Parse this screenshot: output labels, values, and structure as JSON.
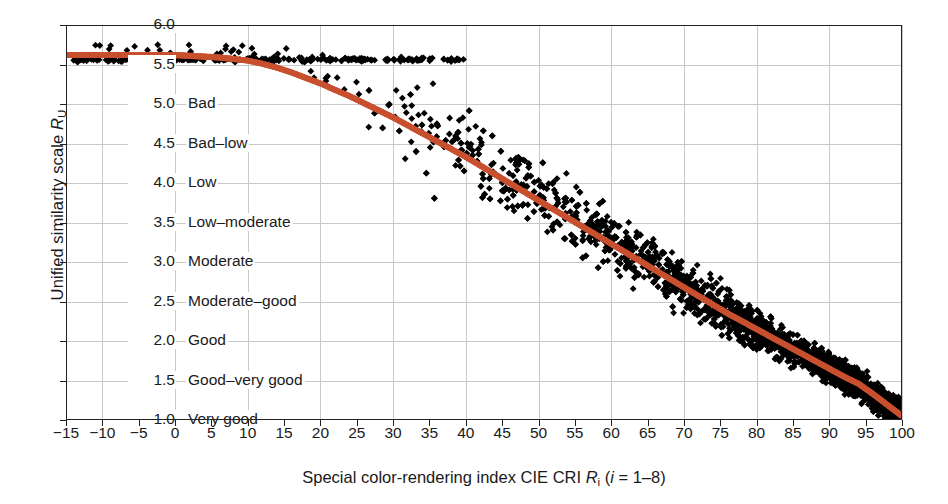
{
  "figure": {
    "title": "",
    "x_axis_title_parts": {
      "pre": "Special color-rendering index CIE CRI ",
      "symbol": "R",
      "subscript": "i",
      "post": " (",
      "italic_i": "i",
      "equals": " = 1–8)"
    },
    "y_axis_title_parts": {
      "pre": "Unified similarity scale ",
      "symbol": "R",
      "subscript": "U"
    }
  },
  "axes": {
    "x_label_full": "Special color-rendering index CIE CRI Ri (i = 1–8)",
    "y_label_full": "Unified similarity scale RU",
    "x_ticks": [
      -15,
      -10,
      -5,
      0,
      5,
      10,
      15,
      20,
      25,
      30,
      35,
      40,
      45,
      50,
      55,
      60,
      65,
      70,
      75,
      80,
      85,
      90,
      95,
      100
    ],
    "x_tick_labels": [
      "−15",
      "−10",
      "−5",
      "0",
      "5",
      "10",
      "15",
      "20",
      "25",
      "30",
      "35",
      "40",
      "45",
      "50",
      "55",
      "60",
      "65",
      "70",
      "75",
      "80",
      "85",
      "90",
      "95",
      "100"
    ],
    "x_gridlines": [
      -10,
      0,
      10,
      20,
      30,
      40,
      50,
      60,
      70,
      80,
      90,
      100
    ],
    "xlim": [
      -15,
      100
    ],
    "y_ticks": [
      1.0,
      1.5,
      2.0,
      2.5,
      3.0,
      3.5,
      4.0,
      4.5,
      5.0,
      5.5,
      6.0
    ],
    "y_tick_labels": [
      "1.0",
      "1.5",
      "2.0",
      "2.5",
      "3.0",
      "3.5",
      "4.0",
      "4.5",
      "5.0",
      "5.5",
      "6.0"
    ],
    "ylim": [
      1.0,
      6.0
    ],
    "grid": "on",
    "grid_color": "#c9c9c9",
    "frame_color": "#222222"
  },
  "scale_descriptors": [
    {
      "value": 5.0,
      "label": "Bad"
    },
    {
      "value": 4.5,
      "label": "Bad–low"
    },
    {
      "value": 4.0,
      "label": "Low"
    },
    {
      "value": 3.5,
      "label": "Low–moderate"
    },
    {
      "value": 3.0,
      "label": "Moderate"
    },
    {
      "value": 2.5,
      "label": "Moderate–good"
    },
    {
      "value": 2.0,
      "label": "Good"
    },
    {
      "value": 1.5,
      "label": "Good–very good"
    },
    {
      "value": 1.0,
      "label": "Very good"
    }
  ],
  "colors": {
    "curve": "#c8502f",
    "scatter": "#000000",
    "grid": "#c9c9c9",
    "axis": "#222222",
    "background": "#ffffff"
  },
  "chart_data": {
    "type": "scatter",
    "title": "",
    "xlabel": "Special color-rendering index CIE CRI Ri (i = 1–8)",
    "ylabel": "Unified similarity scale RU",
    "xlim": [
      -15,
      100
    ],
    "ylim": [
      1.0,
      6.0
    ],
    "grid": true,
    "legend": "none",
    "series": [
      {
        "name": "Fitted relation (CIE CRI Ri vs unified similarity scale RU)",
        "type": "line",
        "color": "#c8502f",
        "marker": "dot",
        "x": [
          -15,
          -12,
          -10,
          -8,
          -6,
          -4,
          -2,
          0,
          2,
          4,
          6,
          8,
          10,
          12,
          14,
          16,
          18,
          20,
          22,
          24,
          26,
          28,
          30,
          32,
          34,
          36,
          38,
          40,
          42,
          44,
          46,
          48,
          50,
          52,
          54,
          56,
          58,
          60,
          62,
          64,
          66,
          68,
          70,
          72,
          74,
          76,
          78,
          80,
          82,
          84,
          86,
          88,
          90,
          92,
          94,
          96,
          98,
          100
        ],
        "y": [
          5.62,
          5.62,
          5.62,
          5.62,
          5.62,
          5.62,
          5.62,
          5.62,
          5.61,
          5.6,
          5.59,
          5.57,
          5.55,
          5.51,
          5.46,
          5.4,
          5.33,
          5.26,
          5.18,
          5.1,
          5.01,
          4.92,
          4.83,
          4.73,
          4.63,
          4.53,
          4.43,
          4.33,
          4.22,
          4.11,
          4.0,
          3.89,
          3.78,
          3.67,
          3.56,
          3.45,
          3.34,
          3.23,
          3.12,
          3.01,
          2.9,
          2.79,
          2.68,
          2.57,
          2.46,
          2.35,
          2.25,
          2.15,
          2.05,
          1.95,
          1.85,
          1.75,
          1.65,
          1.55,
          1.46,
          1.33,
          1.19,
          1.05
        ]
      },
      {
        "name": "Individual light-source samples",
        "type": "scatter",
        "color": "#000000",
        "marker": "diamond",
        "point_count_approx": 1500,
        "description": "Black diamond markers; sparse and near RU ≈ 5.5–5.6 at low CRI, broadening and descending toward RU ≈ 1.0–1.3 near CRI = 100, with the densest concentration between CRI 75 and 100."
      }
    ]
  }
}
